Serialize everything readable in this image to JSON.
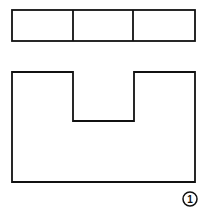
{
  "diagram": {
    "stroke_color": "#111111",
    "background": "#ffffff",
    "top_view": {
      "x": 12,
      "y": 10,
      "width": 183,
      "height": 31,
      "dividers_x": [
        73,
        133
      ]
    },
    "front_view": {
      "path": "M12,72 H73 V121 H134 V72 H195 V182 H12 Z"
    },
    "label": {
      "text": "1",
      "cx": 190,
      "cy": 199,
      "r": 7
    }
  }
}
